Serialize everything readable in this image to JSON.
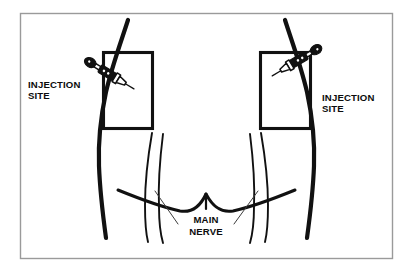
{
  "figure": {
    "kind": "medical-injection-diagram",
    "frame_color": "#9a9a9a",
    "ink_color": "#111111",
    "background_color": "#ffffff"
  },
  "labels": {
    "left_injection_site": {
      "line1": "INJECTION",
      "line2": "SITE"
    },
    "right_injection_site": {
      "line1": "INJECTION",
      "line2": "SITE"
    },
    "main_nerve": {
      "line1": "MAIN",
      "line2": "NERVE"
    }
  },
  "icons": {
    "left_syringe": "syringe-icon",
    "right_syringe": "syringe-icon"
  },
  "regions": {
    "left_site_box": {
      "x": 103,
      "y": 52,
      "width": 49,
      "height": 76
    },
    "right_site_box": {
      "x": 260,
      "y": 52,
      "width": 50,
      "height": 76
    }
  }
}
